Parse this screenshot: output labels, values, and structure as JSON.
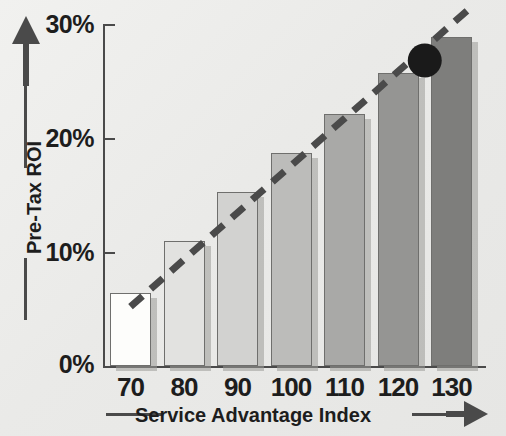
{
  "chart_data": {
    "type": "bar",
    "title": "",
    "xlabel": "Service Advantage Index",
    "ylabel": "Pre-Tax ROI",
    "categories": [
      "70",
      "80",
      "90",
      "100",
      "110",
      "120",
      "130"
    ],
    "x": [
      70,
      80,
      90,
      100,
      110,
      120,
      130
    ],
    "values": [
      6.4,
      11.0,
      15.3,
      18.7,
      22.1,
      25.7,
      28.9
    ],
    "value_unit": "%",
    "ylim": [
      0,
      30
    ],
    "ytick_labels": [
      "0%",
      "10%",
      "20%",
      "30%"
    ],
    "ytick_values": [
      0,
      10,
      20,
      30
    ],
    "xlim": [
      65,
      135
    ],
    "grid": false,
    "legend": null,
    "series": [
      {
        "name": "Pre-Tax ROI",
        "values": [
          6.4,
          11.0,
          15.3,
          18.7,
          22.1,
          25.7,
          28.9
        ]
      }
    ],
    "bar_colors": [
      "#fdfdfb",
      "#e2e2e0",
      "#d2d2d0",
      "#bcbcba",
      "#a9a9a7",
      "#959593",
      "#7e7e7c"
    ],
    "bar_border_color": "#6f6f6d",
    "annotations": [
      {
        "type": "trendline",
        "style": "dashed",
        "color": "#4a4a4a",
        "from": {
          "x": 70,
          "y": 5.2
        },
        "to": {
          "x": 133,
          "y": 31.2
        }
      },
      {
        "type": "marker",
        "shape": "circle",
        "color": "#1a1a1a",
        "x": 125,
        "y": 26.8
      }
    ]
  },
  "axes": {
    "y": {
      "title": "Pre-Tax ROI",
      "arrow": "up-arrow-icon",
      "ticks": [
        {
          "label": "30%",
          "value": 30
        },
        {
          "label": "20%",
          "value": 20
        },
        {
          "label": "10%",
          "value": 10
        },
        {
          "label": "0%",
          "value": 0
        }
      ]
    },
    "x": {
      "title": "Service Advantage Index",
      "arrow": "right-arrow-icon",
      "ticks": [
        {
          "label": "70",
          "value": 70
        },
        {
          "label": "80",
          "value": 80
        },
        {
          "label": "90",
          "value": 90
        },
        {
          "label": "100",
          "value": 100
        },
        {
          "label": "110",
          "value": 110
        },
        {
          "label": "120",
          "value": 120
        },
        {
          "label": "130",
          "value": 130
        }
      ]
    }
  },
  "colors": {
    "background": "#eeeeec",
    "axis": "#4a4a4a",
    "text": "#1d1d1d",
    "marker": "#1a1a1a"
  }
}
